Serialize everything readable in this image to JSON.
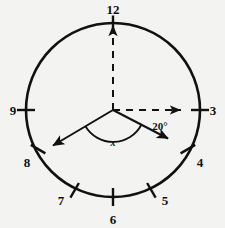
{
  "figure": {
    "background_color": "#f3f3f2",
    "stroke_color": "#111111",
    "circle": {
      "center_x": 113,
      "center_y": 110,
      "radius": 87,
      "stroke_width": 2.6
    }
  },
  "hour_marks": [
    {
      "label": "12",
      "angle_deg": 90,
      "label_x": 113,
      "label_y": 14,
      "anchor": "middle"
    },
    {
      "label": "3",
      "angle_deg": 0,
      "label_x": 211,
      "label_y": 115,
      "anchor": "middle"
    },
    {
      "label": "4",
      "angle_deg": -30,
      "label_x": 196,
      "label_y": 166,
      "anchor": "middle"
    },
    {
      "label": "5",
      "angle_deg": -60,
      "label_x": 163,
      "label_y": 203,
      "anchor": "middle"
    },
    {
      "label": "6",
      "angle_deg": -90,
      "label_x": 113,
      "label_y": 223,
      "anchor": "middle"
    },
    {
      "label": "7",
      "angle_deg": -120,
      "label_x": 62,
      "label_y": 203,
      "anchor": "middle"
    },
    {
      "label": "8",
      "angle_deg": -150,
      "label_x": 29,
      "label_y": 166,
      "anchor": "middle"
    },
    {
      "label": "9",
      "angle_deg": 180,
      "label_x": 15,
      "label_y": 115,
      "anchor": "middle"
    }
  ],
  "rays": {
    "vertical_dashed": {
      "name": "dashed-ray-to-12",
      "from_x": 113,
      "from_y": 110,
      "to_x": 113,
      "to_y": 25,
      "style": "dashed",
      "arrowhead": true
    },
    "horizontal_dashed": {
      "name": "dashed-ray-to-3",
      "from_x": 113,
      "from_y": 110,
      "to_x": 181,
      "to_y": 110,
      "style": "dashed",
      "arrowhead": true
    },
    "solid_left": {
      "name": "solid-ray-lower-left",
      "from_x": 113,
      "from_y": 110,
      "to_x": 52,
      "to_y": 146,
      "style": "solid",
      "arrowhead": true
    },
    "solid_right": {
      "name": "solid-ray-lower-right",
      "from_x": 113,
      "from_y": 110,
      "to_x": 169,
      "to_y": 139,
      "style": "solid",
      "arrowhead": true
    }
  },
  "annotations": {
    "angle_20": {
      "text": "20°",
      "x": 160,
      "y": 129
    },
    "angle_x": {
      "text": "x",
      "x": 113,
      "y": 145
    },
    "arc_x": {
      "center_x": 113,
      "center_y": 110,
      "radius": 32,
      "start_angle_deg": -150,
      "end_angle_deg": -27
    }
  }
}
